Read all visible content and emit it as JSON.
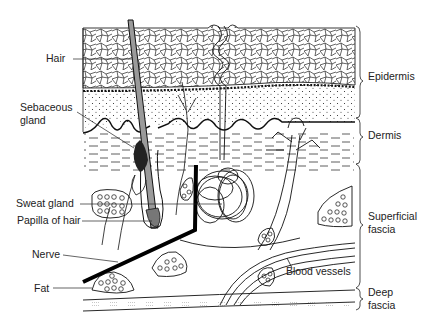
{
  "figure": {
    "background": "#ffffff",
    "ink": "#1a1a1a",
    "hair_shaft_fill": "#9a9a9a"
  },
  "left_labels": [
    {
      "id": "hair",
      "text": "Hair"
    },
    {
      "id": "sebaceous-gland",
      "line1": "Sebaceous",
      "line2": "gland"
    },
    {
      "id": "sweat-gland",
      "text": "Sweat gland"
    },
    {
      "id": "papilla-of-hair",
      "text": "Papilla of hair"
    },
    {
      "id": "nerve",
      "text": "Nerve"
    },
    {
      "id": "fat",
      "text": "Fat"
    }
  ],
  "inline_labels": [
    {
      "id": "blood-vessels",
      "text": "Blood vessels"
    }
  ],
  "layer_labels": [
    {
      "id": "epidermis",
      "text": "Epidermis"
    },
    {
      "id": "dermis",
      "text": "Dermis"
    },
    {
      "id": "superficial-fascia",
      "line1": "Superficial",
      "line2": "fascia"
    },
    {
      "id": "deep-fascia",
      "line1": "Deep",
      "line2": "fascia"
    }
  ]
}
